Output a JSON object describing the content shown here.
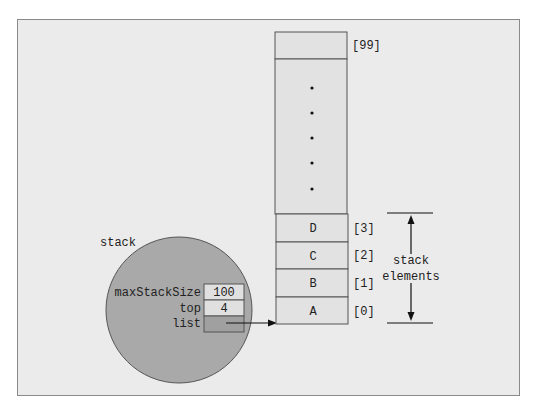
{
  "diagram": {
    "stack_object": {
      "label": "stack",
      "fields": [
        {
          "name": "maxStackSize",
          "value": "100"
        },
        {
          "name": "top",
          "value": "4"
        },
        {
          "name": "list",
          "value": ""
        }
      ]
    },
    "array": {
      "top_index_label": "[99]",
      "ellipsis_dots": 5,
      "cells": [
        {
          "value": "D",
          "index_label": "[3]"
        },
        {
          "value": "C",
          "index_label": "[2]"
        },
        {
          "value": "B",
          "index_label": "[1]"
        },
        {
          "value": "A",
          "index_label": "[0]"
        }
      ]
    },
    "bracket": {
      "line1": "stack",
      "line2": "elements"
    },
    "colors": {
      "frame_bg": "#ebebeb",
      "frame_border": "#8a8a8a",
      "circle_fill": "#a9a9a9",
      "cell_fill": "#e2e2e2",
      "field_box_fill": "#e0e0e0",
      "list_box_fill": "#a0a0a0",
      "line": "#555555",
      "text": "#222222"
    }
  }
}
